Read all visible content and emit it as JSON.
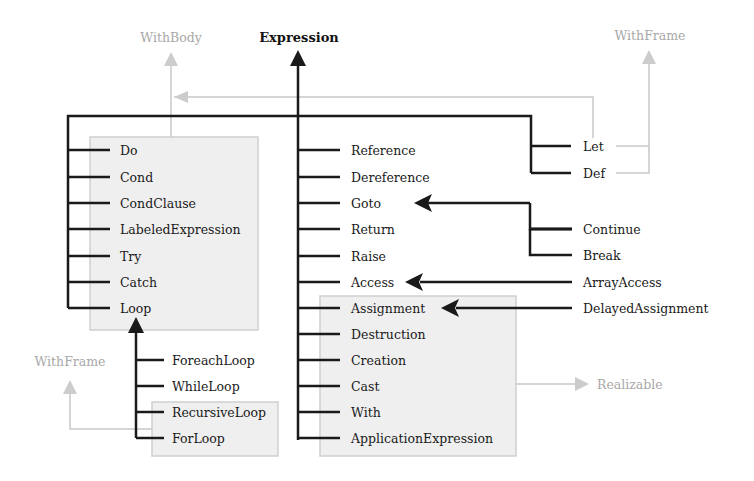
{
  "diagram": {
    "root": "Expression",
    "interfaces": {
      "with_body": "WithBody",
      "with_frame_right": "WithFrame",
      "with_frame_left": "WithFrame",
      "realizable": "Realizable"
    },
    "left_group": [
      "Do",
      "Cond",
      "CondClause",
      "LabeledExpression",
      "Try",
      "Catch",
      "Loop"
    ],
    "loop_children": [
      "ForeachLoop",
      "WhileLoop",
      "RecursiveLoop",
      "ForLoop"
    ],
    "middle_group": [
      "Reference",
      "Dereference",
      "Goto",
      "Return",
      "Raise",
      "Access"
    ],
    "realizable_group": [
      "Assignment",
      "Destruction",
      "Creation",
      "Cast",
      "With",
      "ApplicationExpression"
    ],
    "frame_group": [
      "Let",
      "Def"
    ],
    "goto_children": [
      "Continue",
      "Break"
    ],
    "access_children": [
      "ArrayAccess"
    ],
    "assignment_children": [
      "DelayedAssignment"
    ]
  }
}
